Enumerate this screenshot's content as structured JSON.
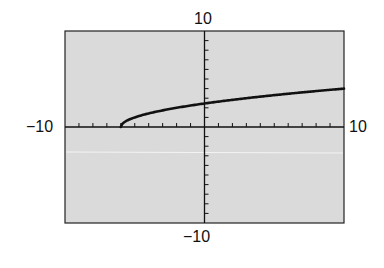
{
  "chart_data": {
    "type": "line",
    "title": "",
    "xlabel": "",
    "ylabel": "",
    "xlim": [
      -10,
      10
    ],
    "ylim": [
      -10,
      10
    ],
    "xscale_ticks": 1,
    "yscale_ticks": 1,
    "grid": false,
    "function": "y = sqrt(x + 6)",
    "series": [
      {
        "name": "f(x)",
        "x": [
          -6,
          -5,
          -4,
          -2,
          0,
          2,
          4,
          6,
          8,
          10
        ],
        "values": [
          0,
          1,
          1.41,
          2,
          2.45,
          2.83,
          3.16,
          3.46,
          3.74,
          4
        ]
      }
    ],
    "tick_labels": {
      "x_min": "−10",
      "x_max": "10",
      "y_min": "−10",
      "y_max": "10"
    }
  },
  "colors": {
    "plot_background": "#d9d9d9",
    "axis": "#111111",
    "curve": "#111111"
  }
}
